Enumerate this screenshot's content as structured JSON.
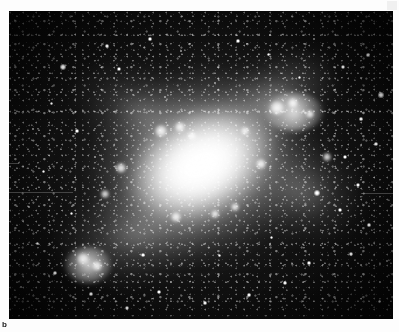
{
  "figure": {
    "label": "b",
    "caption": "",
    "medium": "grayscale astronomical plate",
    "plate": {
      "left": 9,
      "top": 11,
      "width": 384,
      "height": 308,
      "background_color": "#040404",
      "sky_color": "#0a0a0a",
      "light_color": "#ffffff"
    }
  },
  "icons": {
    "page_mark": "page-corner-mark"
  },
  "image_content": {
    "type": "astronomical-image",
    "object_class": "spiral galaxy",
    "orientation_deg": -27,
    "core": {
      "name": "nucleus-bar",
      "center_x": 192,
      "center_y": 154,
      "width": 168,
      "height": 116,
      "peak_brightness": 255
    },
    "halo": {
      "name": "outer-disc-halo",
      "width": 360,
      "height": 300,
      "falloff": "radial"
    },
    "arms": [
      {
        "name": "arm-northeast",
        "x": 188,
        "y": 48,
        "w": 150,
        "h": 86,
        "rot": -34
      },
      {
        "name": "arm-east",
        "x": 232,
        "y": 128,
        "w": 124,
        "h": 104,
        "rot": 18
      },
      {
        "name": "arm-southwest",
        "x": 44,
        "y": 170,
        "w": 168,
        "h": 104,
        "rot": -16
      },
      {
        "name": "arm-northwest",
        "x": 58,
        "y": 56,
        "w": 150,
        "h": 92,
        "rot": 24
      }
    ],
    "bright_knots": [
      {
        "x": 268,
        "y": 97,
        "r": 7
      },
      {
        "x": 284,
        "y": 92,
        "r": 5
      },
      {
        "x": 301,
        "y": 103,
        "r": 4
      },
      {
        "x": 152,
        "y": 120,
        "r": 6
      },
      {
        "x": 171,
        "y": 116,
        "r": 5
      },
      {
        "x": 183,
        "y": 125,
        "r": 4
      },
      {
        "x": 236,
        "y": 120,
        "r": 4
      },
      {
        "x": 252,
        "y": 153,
        "r": 5
      },
      {
        "x": 112,
        "y": 157,
        "r": 5
      },
      {
        "x": 96,
        "y": 183,
        "r": 4
      },
      {
        "x": 167,
        "y": 206,
        "r": 5
      },
      {
        "x": 206,
        "y": 203,
        "r": 4
      },
      {
        "x": 226,
        "y": 196,
        "r": 4
      },
      {
        "x": 318,
        "y": 146,
        "r": 4
      },
      {
        "x": 74,
        "y": 248,
        "r": 6
      },
      {
        "x": 88,
        "y": 255,
        "r": 5
      }
    ],
    "point_sources": [
      {
        "x": 54,
        "y": 56,
        "r": 3.0
      },
      {
        "x": 110,
        "y": 58,
        "r": 2.4
      },
      {
        "x": 98,
        "y": 35,
        "r": 1.8
      },
      {
        "x": 141,
        "y": 28,
        "r": 1.6
      },
      {
        "x": 172,
        "y": 40,
        "r": 1.4
      },
      {
        "x": 229,
        "y": 30,
        "r": 1.6
      },
      {
        "x": 259,
        "y": 43,
        "r": 1.5
      },
      {
        "x": 305,
        "y": 28,
        "r": 1.4
      },
      {
        "x": 334,
        "y": 56,
        "r": 2.0
      },
      {
        "x": 359,
        "y": 44,
        "r": 1.6
      },
      {
        "x": 372,
        "y": 84,
        "r": 2.6
      },
      {
        "x": 352,
        "y": 108,
        "r": 1.6
      },
      {
        "x": 367,
        "y": 133,
        "r": 1.8
      },
      {
        "x": 336,
        "y": 146,
        "r": 2.0
      },
      {
        "x": 349,
        "y": 174,
        "r": 2.4
      },
      {
        "x": 308,
        "y": 182,
        "r": 3.0
      },
      {
        "x": 331,
        "y": 199,
        "r": 2.0
      },
      {
        "x": 360,
        "y": 214,
        "r": 1.6
      },
      {
        "x": 342,
        "y": 243,
        "r": 1.8
      },
      {
        "x": 300,
        "y": 252,
        "r": 1.6
      },
      {
        "x": 276,
        "y": 272,
        "r": 1.8
      },
      {
        "x": 240,
        "y": 284,
        "r": 1.6
      },
      {
        "x": 196,
        "y": 292,
        "r": 1.6
      },
      {
        "x": 150,
        "y": 281,
        "r": 1.8
      },
      {
        "x": 118,
        "y": 297,
        "r": 2.2
      },
      {
        "x": 82,
        "y": 283,
        "r": 1.6
      },
      {
        "x": 46,
        "y": 262,
        "r": 1.8
      },
      {
        "x": 28,
        "y": 232,
        "r": 1.5
      },
      {
        "x": 20,
        "y": 196,
        "r": 1.4
      },
      {
        "x": 34,
        "y": 160,
        "r": 1.5
      },
      {
        "x": 24,
        "y": 118,
        "r": 1.4
      },
      {
        "x": 42,
        "y": 92,
        "r": 1.5
      },
      {
        "x": 68,
        "y": 120,
        "r": 1.6
      },
      {
        "x": 86,
        "y": 146,
        "r": 1.4
      },
      {
        "x": 62,
        "y": 202,
        "r": 1.5
      },
      {
        "x": 134,
        "y": 244,
        "r": 1.8
      },
      {
        "x": 210,
        "y": 244,
        "r": 1.5
      },
      {
        "x": 262,
        "y": 226,
        "r": 1.5
      },
      {
        "x": 290,
        "y": 66,
        "r": 1.5
      },
      {
        "x": 206,
        "y": 72,
        "r": 1.4
      },
      {
        "x": 156,
        "y": 86,
        "r": 1.4
      },
      {
        "x": 378,
        "y": 250,
        "r": 1.4
      },
      {
        "x": 12,
        "y": 276,
        "r": 1.4
      },
      {
        "x": 370,
        "y": 290,
        "r": 1.5
      }
    ],
    "artifacts": [
      {
        "name": "scanline-left",
        "x": 0,
        "y": 181,
        "w": 64,
        "h": 1
      },
      {
        "name": "scanline-right",
        "x": 352,
        "y": 182,
        "w": 32,
        "h": 1
      },
      {
        "name": "scanline-edge",
        "x": 0,
        "y": 152,
        "w": 10,
        "h": 1
      }
    ]
  }
}
